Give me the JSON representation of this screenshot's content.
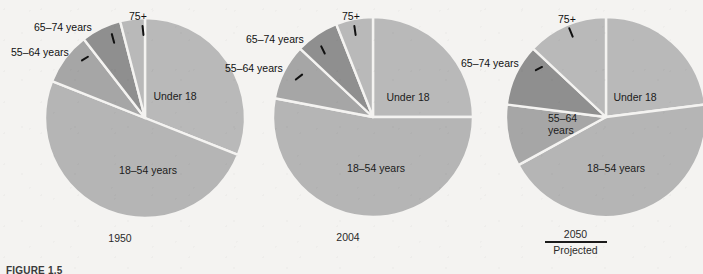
{
  "figure": {
    "caption": "FIGURE 1.5",
    "background_color": "#f4f3f1"
  },
  "colors": {
    "under18": "#b9b9b9",
    "age18_54": "#b5b5b5",
    "age55_64": "#a6a6a6",
    "age65_74": "#8f8f8f",
    "age75plus": "#b9b9b9",
    "separator": "#f4f3f1",
    "text": "#1b1b1b"
  },
  "labels": {
    "under18": "Under 18",
    "age18_54": "18–54 years",
    "age55_64": "55–64 years",
    "age55_64_line1": "55–64",
    "age55_64_line2": "years",
    "age65_74": "65–74 years",
    "age75plus": "75+",
    "projected": "Projected"
  },
  "chart_data": {
    "type": "pie",
    "title": "",
    "categories": [
      "Under 18",
      "18–54 years",
      "55–64 years",
      "65–74 years",
      "75+"
    ],
    "legend_position": "callout-labels",
    "charts": [
      {
        "year": "1950",
        "year_label": "1950",
        "projected": false,
        "values": [
          31,
          50,
          8.5,
          6.5,
          4
        ],
        "slices": [
          {
            "name": "Under 18",
            "percent": 31,
            "color": "#b9b9b9",
            "label_mode": "inside"
          },
          {
            "name": "18–54 years",
            "percent": 50,
            "color": "#b5b5b5",
            "label_mode": "inside"
          },
          {
            "name": "55–64 years",
            "percent": 8.5,
            "color": "#a6a6a6",
            "label_mode": "callout"
          },
          {
            "name": "65–74 years",
            "percent": 6.5,
            "color": "#8f8f8f",
            "label_mode": "callout"
          },
          {
            "name": "75+",
            "percent": 4,
            "color": "#b9b9b9",
            "label_mode": "callout"
          }
        ]
      },
      {
        "year": "2004",
        "year_label": "2004",
        "projected": false,
        "values": [
          25,
          53,
          9,
          7,
          6
        ],
        "slices": [
          {
            "name": "Under 18",
            "percent": 25,
            "color": "#b9b9b9",
            "label_mode": "inside"
          },
          {
            "name": "18–54 years",
            "percent": 53,
            "color": "#b5b5b5",
            "label_mode": "inside"
          },
          {
            "name": "55–64 years",
            "percent": 9,
            "color": "#a6a6a6",
            "label_mode": "callout"
          },
          {
            "name": "65–74 years",
            "percent": 7,
            "color": "#8f8f8f",
            "label_mode": "callout"
          },
          {
            "name": "75+",
            "percent": 6,
            "color": "#b9b9b9",
            "label_mode": "callout"
          }
        ]
      },
      {
        "year": "2050",
        "year_label": "2050",
        "projected": true,
        "values": [
          23,
          44,
          10,
          10,
          13
        ],
        "slices": [
          {
            "name": "Under 18",
            "percent": 23,
            "color": "#b9b9b9",
            "label_mode": "inside"
          },
          {
            "name": "18–54 years",
            "percent": 44,
            "color": "#b5b5b5",
            "label_mode": "inside"
          },
          {
            "name": "55–64 years",
            "percent": 10,
            "color": "#a6a6a6",
            "label_mode": "inside"
          },
          {
            "name": "65–74 years",
            "percent": 10,
            "color": "#8f8f8f",
            "label_mode": "callout"
          },
          {
            "name": "75+",
            "percent": 13,
            "color": "#b9b9b9",
            "label_mode": "callout"
          }
        ]
      }
    ]
  }
}
